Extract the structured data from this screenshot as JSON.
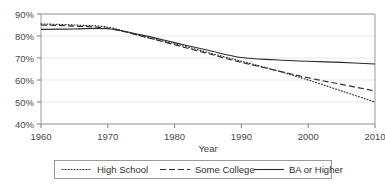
{
  "chart_data": {
    "type": "line",
    "title": "",
    "xlabel": "Year",
    "ylabel": "",
    "xlim": [
      1960,
      2010
    ],
    "ylim": [
      40,
      90
    ],
    "grid": true,
    "legend_position": "bottom",
    "x_ticks": [
      "1960",
      "1970",
      "1980",
      "1990",
      "2000",
      "2010"
    ],
    "x_tick_values": [
      1960,
      1970,
      1980,
      1990,
      2000,
      2010
    ],
    "y_ticks": [
      "40%",
      "50%",
      "60%",
      "70%",
      "80%",
      "90%"
    ],
    "y_tick_values": [
      40,
      50,
      60,
      70,
      80,
      90
    ],
    "x": [
      1960,
      1965,
      1970,
      1975,
      1980,
      1985,
      1990,
      1995,
      2000,
      2005,
      2010
    ],
    "series": [
      {
        "name": "High School",
        "style": "dotted",
        "values": [
          85.5,
          85.0,
          84.0,
          80.0,
          76.5,
          72.5,
          68.5,
          64.5,
          60.0,
          55.0,
          50.0
        ]
      },
      {
        "name": "Some College",
        "style": "dashed",
        "values": [
          85.0,
          84.5,
          83.5,
          80.0,
          76.0,
          72.0,
          68.0,
          64.5,
          61.0,
          58.0,
          55.0
        ]
      },
      {
        "name": "BA or Higher",
        "style": "solid",
        "values": [
          83.0,
          83.2,
          83.3,
          80.5,
          77.0,
          73.5,
          70.2,
          69.2,
          68.5,
          68.0,
          67.3
        ]
      }
    ]
  },
  "legend": {
    "items": [
      {
        "label": "High School",
        "style": "dotted"
      },
      {
        "label": "Some College",
        "style": "dashed"
      },
      {
        "label": "BA or Higher",
        "style": "solid"
      }
    ]
  },
  "colors": {
    "line": "#2b2b2b",
    "grid": "#e2e2e2",
    "frame": "#9a9a9a",
    "text": "#3a3a3a",
    "background": "#ffffff"
  }
}
